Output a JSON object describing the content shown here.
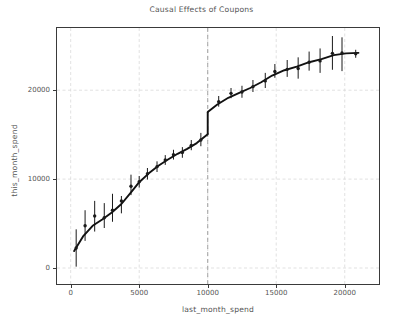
{
  "chart_data": {
    "type": "scatter",
    "title": "Causal Effects of Coupons",
    "xlabel": "last_month_spend",
    "ylabel": "this_month_spend",
    "xlim": [
      -1000,
      22500
    ],
    "ylim": [
      -1800,
      27000
    ],
    "grid": true,
    "legend": null,
    "xticks": [
      0,
      5000,
      10000,
      15000,
      20000
    ],
    "xtick_labels": [
      "0",
      "5000",
      "10000",
      "15000",
      "20000"
    ],
    "yticks": [
      0,
      10000,
      20000
    ],
    "ytick_labels": [
      "0",
      "10000",
      "20000"
    ],
    "marker_color": "#1a1a1a",
    "line_color": "#111111",
    "grid_color": "#d9d9d9",
    "axis_color": "#3a3a3a",
    "text_color": "#555555",
    "cutoff": {
      "x": 10000,
      "label": "",
      "style": "dashed",
      "color": "#9a9a9a"
    },
    "discontinuity": {
      "x": 10000,
      "y_before": 15050,
      "y_after": 17550,
      "jump": 2500
    },
    "series": [
      {
        "name": "binned means with 95% CI",
        "points": [
          {
            "x": 400,
            "y": 2250,
            "yerr_low": 150,
            "yerr_high": 4350
          },
          {
            "x": 1050,
            "y": 4750,
            "yerr_low": 3050,
            "yerr_high": 6500
          },
          {
            "x": 1750,
            "y": 5850,
            "yerr_low": 4100,
            "yerr_high": 7550
          },
          {
            "x": 2450,
            "y": 5650,
            "yerr_low": 4500,
            "yerr_high": 7300
          },
          {
            "x": 3050,
            "y": 6500,
            "yerr_low": 5200,
            "yerr_high": 8350
          },
          {
            "x": 3700,
            "y": 7550,
            "yerr_low": 6150,
            "yerr_high": 8100
          },
          {
            "x": 4400,
            "y": 9200,
            "yerr_low": 8200,
            "yerr_high": 10500
          },
          {
            "x": 5000,
            "y": 9700,
            "yerr_low": 9050,
            "yerr_high": 10350
          },
          {
            "x": 5600,
            "y": 10600,
            "yerr_low": 9950,
            "yerr_high": 11250
          },
          {
            "x": 6300,
            "y": 11400,
            "yerr_low": 10800,
            "yerr_high": 12000
          },
          {
            "x": 6900,
            "y": 12150,
            "yerr_low": 11600,
            "yerr_high": 12700
          },
          {
            "x": 7500,
            "y": 12750,
            "yerr_low": 12200,
            "yerr_high": 13300
          },
          {
            "x": 8150,
            "y": 13000,
            "yerr_low": 12400,
            "yerr_high": 13600
          },
          {
            "x": 8800,
            "y": 13800,
            "yerr_low": 13250,
            "yerr_high": 14400
          },
          {
            "x": 9500,
            "y": 14400,
            "yerr_low": 13700,
            "yerr_high": 15200
          },
          {
            "x": 10800,
            "y": 18700,
            "yerr_low": 18150,
            "yerr_high": 19350
          },
          {
            "x": 11700,
            "y": 19650,
            "yerr_low": 19100,
            "yerr_high": 20250
          },
          {
            "x": 12500,
            "y": 19800,
            "yerr_low": 19150,
            "yerr_high": 20500
          },
          {
            "x": 13300,
            "y": 20400,
            "yerr_low": 19800,
            "yerr_high": 21150
          },
          {
            "x": 14200,
            "y": 21050,
            "yerr_low": 20250,
            "yerr_high": 21950
          },
          {
            "x": 14900,
            "y": 22100,
            "yerr_low": 21400,
            "yerr_high": 22950
          },
          {
            "x": 15800,
            "y": 22350,
            "yerr_low": 21500,
            "yerr_high": 23400
          },
          {
            "x": 16600,
            "y": 22450,
            "yerr_low": 21300,
            "yerr_high": 23700
          },
          {
            "x": 17400,
            "y": 23150,
            "yerr_low": 22200,
            "yerr_high": 24350
          },
          {
            "x": 18200,
            "y": 23300,
            "yerr_low": 21950,
            "yerr_high": 24700
          },
          {
            "x": 19100,
            "y": 24150,
            "yerr_low": 22300,
            "yerr_high": 26100
          },
          {
            "x": 19800,
            "y": 24200,
            "yerr_low": 22150,
            "yerr_high": 25950
          },
          {
            "x": 20800,
            "y": 24100,
            "yerr_low": 23650,
            "yerr_high": 24550
          }
        ]
      }
    ],
    "fit_line": {
      "name": "fitted regression",
      "left_segment": [
        {
          "x": 250,
          "y": 1900
        },
        {
          "x": 900,
          "y": 3550
        },
        {
          "x": 1600,
          "y": 4750
        },
        {
          "x": 2300,
          "y": 5450
        },
        {
          "x": 3000,
          "y": 6250
        },
        {
          "x": 3700,
          "y": 7200
        },
        {
          "x": 4400,
          "y": 8500
        },
        {
          "x": 5000,
          "y": 9650
        },
        {
          "x": 5700,
          "y": 10650
        },
        {
          "x": 6400,
          "y": 11500
        },
        {
          "x": 7100,
          "y": 12200
        },
        {
          "x": 7800,
          "y": 12850
        },
        {
          "x": 8500,
          "y": 13400
        },
        {
          "x": 9200,
          "y": 14050
        },
        {
          "x": 10000,
          "y": 15050
        }
      ],
      "right_segment": [
        {
          "x": 10000,
          "y": 17550
        },
        {
          "x": 10700,
          "y": 18400
        },
        {
          "x": 11500,
          "y": 19150
        },
        {
          "x": 12300,
          "y": 19700
        },
        {
          "x": 13100,
          "y": 20250
        },
        {
          "x": 13900,
          "y": 20900
        },
        {
          "x": 14700,
          "y": 21650
        },
        {
          "x": 15600,
          "y": 22250
        },
        {
          "x": 16500,
          "y": 22650
        },
        {
          "x": 17400,
          "y": 23150
        },
        {
          "x": 18300,
          "y": 23500
        },
        {
          "x": 19200,
          "y": 23950
        },
        {
          "x": 20100,
          "y": 24150
        },
        {
          "x": 21000,
          "y": 24200
        }
      ]
    }
  }
}
